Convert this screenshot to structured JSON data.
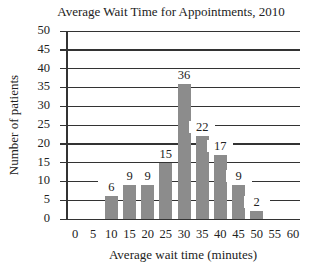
{
  "chart_data": {
    "type": "bar",
    "title": "Average Wait Time for Appointments, 2010",
    "xlabel": "Average wait time (minutes)",
    "ylabel": "Number of patients",
    "x_ticks": [
      "0",
      "5",
      "10",
      "15",
      "20",
      "25",
      "30",
      "35",
      "40",
      "45",
      "50",
      "55",
      "60"
    ],
    "y_ticks": [
      "0",
      "5",
      "10",
      "15",
      "20",
      "25",
      "30",
      "35",
      "40",
      "45",
      "50"
    ],
    "categories": [
      10,
      15,
      20,
      25,
      30,
      35,
      40,
      45,
      50
    ],
    "values": [
      6,
      9,
      9,
      15,
      36,
      22,
      17,
      9,
      2
    ],
    "data_labels": [
      "6",
      "9",
      "9",
      "15",
      "36",
      "22",
      "17",
      "9",
      "2"
    ],
    "xlim": [
      0,
      60
    ],
    "ylim": [
      0,
      50
    ],
    "grid": "horizontal",
    "bar_color": "#8c8c8c"
  }
}
